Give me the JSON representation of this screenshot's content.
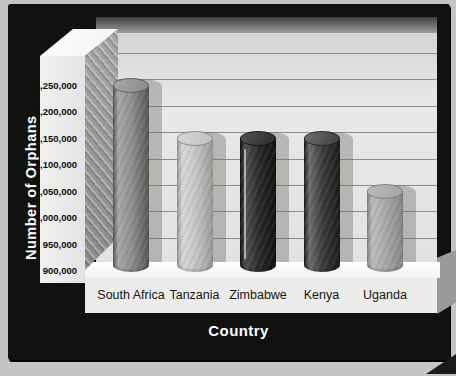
{
  "axes": {
    "y_title": "Number of Orphans",
    "x_title": "Country"
  },
  "chart_data": {
    "type": "bar",
    "style_hint": "3d-cylinder-bars-in-black-frame",
    "categories": [
      "South Africa",
      "Tanzania",
      "Zimbabwe",
      "Kenya",
      "Uganda"
    ],
    "values": [
      1250000,
      1150000,
      1150000,
      1150000,
      1050000
    ],
    "title": "",
    "xlabel": "Country",
    "ylabel": "Number of Orphans",
    "ylim": [
      900000,
      1250000
    ],
    "ytick_step": 50000,
    "ytick_labels_top_to_bottom": [
      "1,250,000",
      "1,200,000",
      "1,150,000",
      "1,100,000",
      "1,050,000",
      "1,000,000",
      "950,000",
      "900,000"
    ],
    "grid": "horizontal",
    "legend": "none"
  },
  "style": {
    "frame_color": "#111110",
    "wall_color": "#e2e2e0",
    "gridline_color": "#8c8c8a",
    "floor_color": "#f4f4f2",
    "label_color": "#161614",
    "title_color": "#ffffff",
    "shadow_color": "rgba(104,104,102,0.38)",
    "bars": [
      {
        "name": "south-africa",
        "hi": "#a8a8a6",
        "mid": "#8e8e8c",
        "dark": "#585856",
        "top": "#8a8a88",
        "rim": "rgba(55,55,53,0.55)",
        "streak": false
      },
      {
        "name": "tanzania",
        "hi": "#d6d6d4",
        "mid": "#c6c6c4",
        "dark": "#9a9a98",
        "top": "#c0c0be",
        "rim": "rgba(95,95,93,0.55)",
        "streak": false
      },
      {
        "name": "zimbabwe",
        "hi": "#525250",
        "mid": "#2a2a28",
        "dark": "#121210",
        "top": "#2c2c2a",
        "rim": "rgba(0,0,0,0.6)",
        "streak": true
      },
      {
        "name": "kenya",
        "hi": "#6e6e6c",
        "mid": "#3a3a38",
        "dark": "#1c1c1a",
        "top": "#403e3e",
        "rim": "rgba(12,12,10,0.6)",
        "streak": false
      },
      {
        "name": "uganda",
        "hi": "#bcbcba",
        "mid": "#a8a8a6",
        "dark": "#868684",
        "top": "#a4a4a2",
        "rim": "rgba(95,95,93,0.55)",
        "streak": false
      }
    ]
  }
}
